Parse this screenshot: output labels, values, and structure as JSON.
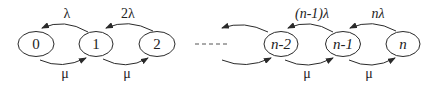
{
  "diagram": {
    "type": "birth-death-chain",
    "nodes": [
      {
        "id": "0",
        "label": "0",
        "italic": false
      },
      {
        "id": "1",
        "label": "1",
        "italic": false
      },
      {
        "id": "2",
        "label": "2",
        "italic": false
      },
      {
        "id": "n-2",
        "label": "n-2",
        "italic": true
      },
      {
        "id": "n-1",
        "label": "n-1",
        "italic": true
      },
      {
        "id": "n",
        "label": "n",
        "italic": true
      }
    ],
    "ellipsis": "- - - - -",
    "upper_rates": [
      {
        "from": "1",
        "to": "0",
        "label": "λ"
      },
      {
        "from": "2",
        "to": "1",
        "label": "2λ"
      },
      {
        "from": "n-2",
        "to": "...",
        "label": ""
      },
      {
        "from": "n-1",
        "to": "n-2",
        "label": "(n-1)λ"
      },
      {
        "from": "n",
        "to": "n-1",
        "label": "nλ"
      }
    ],
    "lower_rates": [
      {
        "from": "0",
        "to": "1",
        "label": "μ"
      },
      {
        "from": "1",
        "to": "2",
        "label": "μ"
      },
      {
        "from": "...",
        "to": "n-2",
        "label": ""
      },
      {
        "from": "n-2",
        "to": "n-1",
        "label": "μ"
      },
      {
        "from": "n-1",
        "to": "n",
        "label": "μ"
      }
    ],
    "colors": {
      "stroke": "#2a2a2a",
      "text": "#222222",
      "background": "#ffffff"
    }
  }
}
